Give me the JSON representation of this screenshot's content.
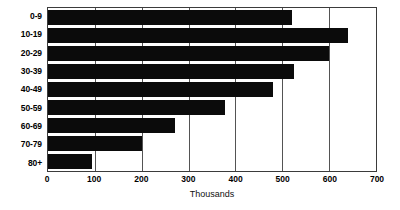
{
  "chart_data": {
    "type": "bar",
    "orientation": "horizontal",
    "title": "",
    "subtitle": "",
    "xlabel": "Thousands",
    "ylabel": "",
    "categories": [
      "0-9",
      "10-19",
      "20-29",
      "30-39",
      "40-49",
      "50-59",
      "60-69",
      "70-79",
      "80+"
    ],
    "values": [
      520,
      640,
      600,
      525,
      480,
      378,
      270,
      200,
      93
    ],
    "series": [
      {
        "name": "Population",
        "values": [
          520,
          640,
          600,
          525,
          480,
          378,
          270,
          200,
          93
        ]
      }
    ],
    "xlim": [
      0,
      700
    ],
    "x_ticks": [
      0,
      100,
      200,
      300,
      400,
      500,
      600,
      700
    ],
    "x_tick_labels": [
      "0",
      "100",
      "200",
      "300",
      "400",
      "500",
      "600",
      "700"
    ],
    "grid": "vertical",
    "legend": false,
    "legend_position": "none",
    "bar_color": "#0b0b0b",
    "grid_color": "#545454",
    "axis_color": "#3b3b3b",
    "background_color": "#ffffff",
    "annotations": []
  }
}
